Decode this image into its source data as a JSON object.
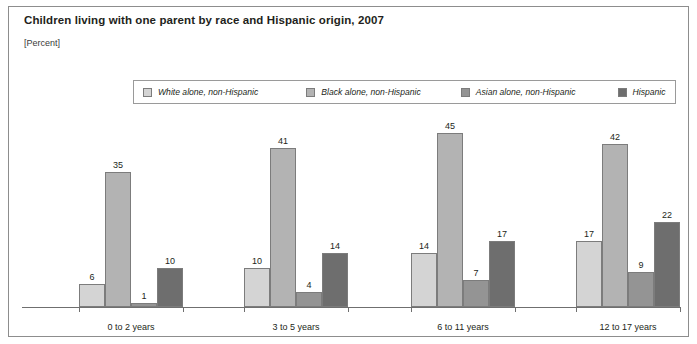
{
  "figure": {
    "title": "Children living with one parent by race and Hispanic origin, 2007",
    "subtitle": "[Percent]"
  },
  "chart_data": {
    "type": "bar",
    "title": "Children living with one parent by race and Hispanic origin, 2007",
    "subtitle": "[Percent]",
    "xlabel": "",
    "ylabel": "Percent",
    "ylim": [
      0,
      45
    ],
    "grid": false,
    "legend_position": "top-center",
    "categories": [
      "0 to 2 years",
      "3 to 5 years",
      "6 to 11 years",
      "12 to 17 years"
    ],
    "series": [
      {
        "name": "White alone, non-Hispanic",
        "color": "#d4d4d4",
        "values": [
          6,
          10,
          14,
          17
        ]
      },
      {
        "name": "Black alone, non-Hispanic",
        "color": "#b3b3b3",
        "values": [
          35,
          41,
          45,
          42
        ]
      },
      {
        "name": "Asian alone, non-Hispanic",
        "color": "#949494",
        "values": [
          1,
          4,
          7,
          9
        ]
      },
      {
        "name": "Hispanic",
        "color": "#6e6e6e",
        "values": [
          10,
          14,
          17,
          22
        ]
      }
    ]
  }
}
